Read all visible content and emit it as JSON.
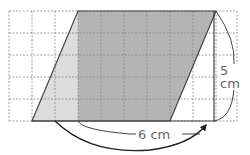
{
  "figure": {
    "grid": {
      "columns": 10,
      "rows": 5
    },
    "labels": {
      "height": "5 cm",
      "base": "6 cm"
    },
    "colors": {
      "rectangle_fill": "#b4b4b4",
      "triangle_fill": "#dcdcdc",
      "grid_line": "#888888",
      "outline": "#444444"
    }
  }
}
